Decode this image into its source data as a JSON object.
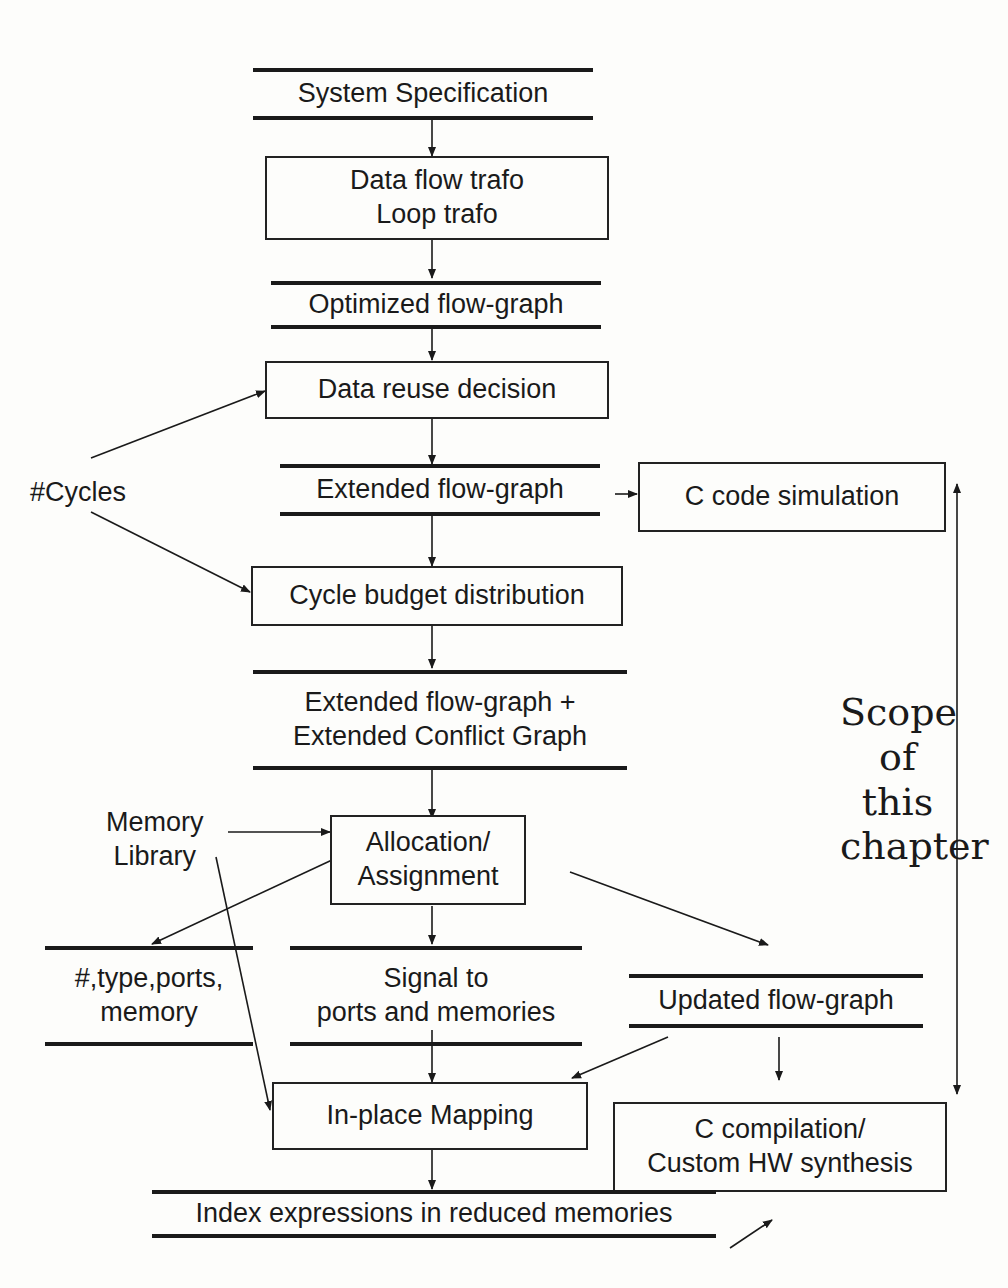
{
  "stores": {
    "system_spec": "System Specification",
    "optimized_flow_graph": "Optimized flow-graph",
    "extended_flow_graph": "Extended flow-graph",
    "extended_fg_cg_line1": "Extended flow-graph +",
    "extended_fg_cg_line2": "Extended Conflict Graph",
    "type_ports_line1": "#,type,ports,",
    "type_ports_line2": "memory",
    "signal_line1": "Signal to",
    "signal_line2": "ports and memories",
    "updated_flow_graph": "Updated flow-graph",
    "index_expressions": "Index expressions in reduced memories"
  },
  "processes": {
    "trafo_line1": "Data flow trafo",
    "trafo_line2": "Loop trafo",
    "data_reuse": "Data reuse decision",
    "c_code_sim": "C code simulation",
    "cycle_budget": "Cycle budget distribution",
    "alloc_line1": "Allocation/",
    "alloc_line2": "Assignment",
    "in_place": "In-place Mapping",
    "ccomp_line1": "C compilation/",
    "ccomp_line2": "Custom HW synthesis"
  },
  "inputs": {
    "cycles": "#Cycles",
    "memory_lib_line1": "Memory",
    "memory_lib_line2": "Library"
  },
  "scope": {
    "line1": "Scope",
    "line2": "of",
    "line3": "this",
    "line4": "chapter"
  }
}
